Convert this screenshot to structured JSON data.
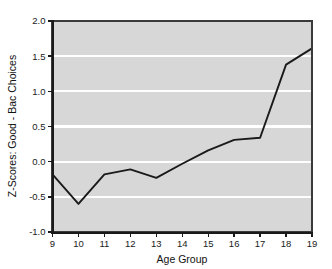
{
  "chart_data": {
    "type": "line",
    "title": "",
    "subtitle": "",
    "xlabel": "Age Group",
    "ylabel": "Z-Scores: Good - Bac Choices",
    "x": [
      9,
      10,
      11,
      12,
      13,
      14,
      15,
      16,
      17,
      18,
      19
    ],
    "categories": [
      "9",
      "10",
      "11",
      "12",
      "13",
      "14",
      "15",
      "16",
      "17",
      "18",
      "19"
    ],
    "values": [
      -0.18,
      -0.6,
      -0.18,
      -0.11,
      -0.23,
      -0.03,
      0.16,
      0.31,
      0.34,
      1.38,
      1.61
    ],
    "series": [
      {
        "name": "Z-Score",
        "values": [
          -0.18,
          -0.6,
          -0.18,
          -0.11,
          -0.23,
          -0.03,
          0.16,
          0.31,
          0.34,
          1.38,
          1.61
        ]
      }
    ],
    "xlim": [
      9,
      19
    ],
    "ylim": [
      -1.0,
      2.0
    ],
    "xticks": [
      9,
      10,
      11,
      12,
      13,
      14,
      15,
      16,
      17,
      18,
      19
    ],
    "yticks": [
      -1.0,
      -0.5,
      0.0,
      0.5,
      1.0,
      1.5,
      2.0
    ],
    "xtick_labels": [
      "9",
      "10",
      "11",
      "12",
      "13",
      "14",
      "15",
      "16",
      "17",
      "18",
      "19"
    ],
    "ytick_labels": [
      "-1.0",
      "-0.5",
      "0.0",
      "0.5",
      "1.0",
      "1.5",
      "2.0"
    ],
    "grid": true,
    "grid_orientation": "horizontal",
    "grid_color": "#ffffff",
    "plot_background": "#d7d7d7",
    "figure_background": "#ffffff",
    "line_color": "#1a1a1a",
    "line_width": 1.8,
    "markers": false,
    "legend": null,
    "legend_position": "none",
    "annotations": []
  },
  "axes": {
    "y_title": "Z-Scores: Good - Bac Choices",
    "x_title": "Age Group"
  }
}
